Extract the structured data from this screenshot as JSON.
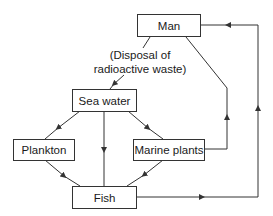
{
  "diagram": {
    "type": "flowchart",
    "nodes": {
      "man": "Man",
      "sea_water": "Sea water",
      "plankton": "Plankton",
      "marine_plants": "Marine plants",
      "fish": "Fish"
    },
    "annotation": {
      "line1": "(Disposal of",
      "line2": "radioactive waste)"
    },
    "edges": [
      {
        "from": "Man",
        "to": "Sea water",
        "label": "(Disposal of radioactive waste)"
      },
      {
        "from": "Sea water",
        "to": "Plankton"
      },
      {
        "from": "Sea water",
        "to": "Fish"
      },
      {
        "from": "Sea water",
        "to": "Marine plants"
      },
      {
        "from": "Plankton",
        "to": "Fish"
      },
      {
        "from": "Marine plants",
        "to": "Fish"
      },
      {
        "from": "Marine plants",
        "to": "Man"
      },
      {
        "from": "Fish",
        "to": "Man"
      }
    ],
    "colors": {
      "line": "#333333",
      "background": "#ffffff"
    }
  }
}
